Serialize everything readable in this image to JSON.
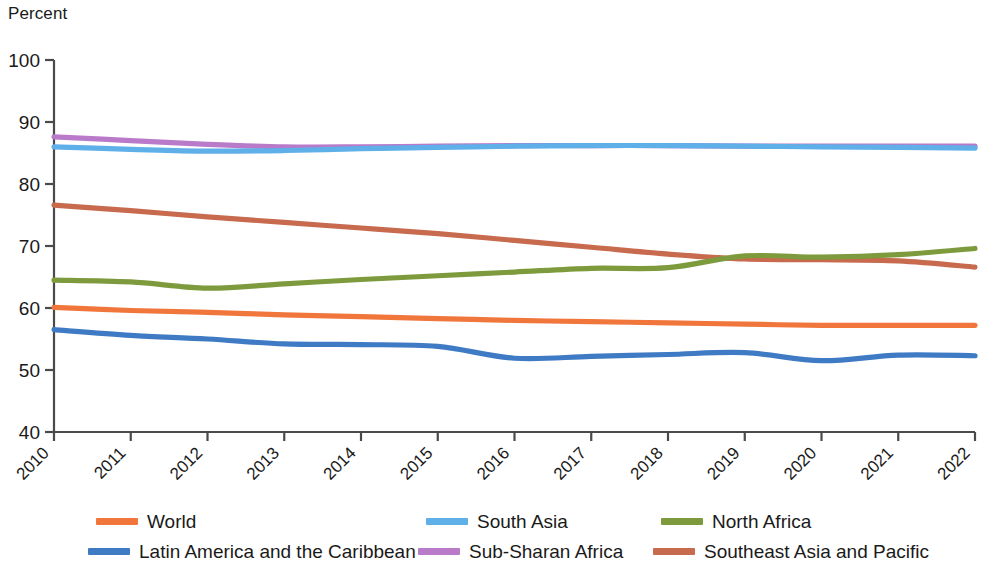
{
  "axis_unit_label": "Percent",
  "chart_data": {
    "type": "line",
    "title": "",
    "subtitle": "",
    "xlabel": "",
    "ylabel": "Percent",
    "xlim": [
      2010,
      2022
    ],
    "ylim": [
      40,
      100
    ],
    "y_ticks": [
      40,
      50,
      60,
      70,
      80,
      90,
      100
    ],
    "x_ticks": [
      2010,
      2011,
      2012,
      2013,
      2014,
      2015,
      2016,
      2017,
      2018,
      2019,
      2020,
      2021,
      2022
    ],
    "grid": false,
    "legend_position": "bottom",
    "x": [
      2010,
      2011,
      2012,
      2013,
      2014,
      2015,
      2016,
      2017,
      2018,
      2019,
      2020,
      2021,
      2022
    ],
    "series": [
      {
        "name": "World",
        "color": "#F0763C",
        "values": [
          60.1,
          59.6,
          59.3,
          58.9,
          58.6,
          58.3,
          58.0,
          57.8,
          57.6,
          57.4,
          57.2,
          57.2,
          57.2
        ]
      },
      {
        "name": "South Asia",
        "color": "#5FAFE8",
        "values": [
          86.0,
          85.6,
          85.3,
          85.4,
          85.7,
          85.9,
          86.1,
          86.2,
          86.2,
          86.1,
          86.0,
          85.9,
          85.8
        ]
      },
      {
        "name": "North Africa",
        "color": "#7D9B3D",
        "values": [
          64.5,
          64.2,
          63.2,
          63.9,
          64.6,
          65.2,
          65.8,
          66.4,
          66.5,
          68.4,
          68.2,
          68.6,
          69.6
        ]
      },
      {
        "name": "Latin America and the Caribbean",
        "color": "#3E7BC4",
        "values": [
          56.5,
          55.6,
          55.0,
          54.2,
          54.1,
          53.8,
          51.9,
          52.2,
          52.5,
          52.8,
          51.5,
          52.4,
          52.3
        ]
      },
      {
        "name": "Sub-Sharan Africa",
        "color": "#B97BC9",
        "values": [
          87.6,
          87.0,
          86.4,
          86.0,
          86.0,
          86.1,
          86.2,
          86.2,
          86.2,
          86.1,
          86.1,
          86.1,
          86.1
        ]
      },
      {
        "name": "Southeast Asia and Pacific",
        "color": "#C76A4E",
        "values": [
          76.6,
          75.7,
          74.7,
          73.8,
          72.9,
          72.0,
          70.9,
          69.8,
          68.7,
          67.9,
          67.8,
          67.6,
          66.6
        ]
      }
    ]
  },
  "legend": {
    "items": [
      {
        "label": "World",
        "color": "#F0763C"
      },
      {
        "label": "South Asia",
        "color": "#5FAFE8"
      },
      {
        "label": "North Africa",
        "color": "#7D9B3D"
      },
      {
        "label": "Latin America and the Caribbean",
        "color": "#3E7BC4"
      },
      {
        "label": "Sub-Sharan Africa",
        "color": "#B97BC9"
      },
      {
        "label": "Southeast Asia and Pacific",
        "color": "#C76A4E"
      }
    ]
  },
  "axis": {
    "color": "#4a4a4a"
  }
}
